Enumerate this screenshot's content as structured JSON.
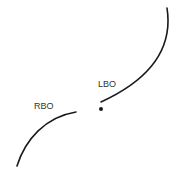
{
  "diagram": {
    "labels": {
      "lbo": "LBO",
      "rbo": "RBO"
    },
    "colors": {
      "stroke": "#1a1a1a",
      "text": "#333333",
      "background": "#ffffff"
    }
  }
}
